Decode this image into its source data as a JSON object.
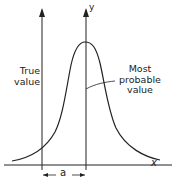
{
  "diagram": {
    "type": "distribution-curve",
    "axis_labels": {
      "x": "x",
      "y": "y"
    },
    "labels": {
      "true_value": "True value",
      "true_value_line1": "True",
      "true_value_line2": "value",
      "most_probable_value": "Most probable value",
      "most_probable_line1": "Most probable",
      "most_probable_line2": "value",
      "offset": "a"
    },
    "colors": {
      "stroke": "#222222",
      "background": "#ffffff"
    }
  }
}
